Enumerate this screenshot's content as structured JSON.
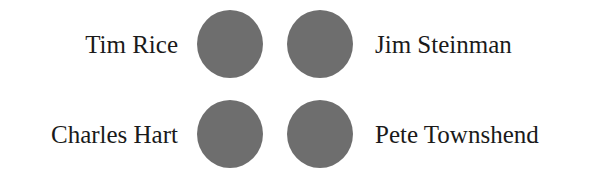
{
  "circle_color": "#6e6e6e",
  "rows": [
    {
      "left_label": "Tim Rice",
      "right_label": "Jim Steinman"
    },
    {
      "left_label": "Charles Hart",
      "right_label": "Pete Townshend"
    }
  ]
}
